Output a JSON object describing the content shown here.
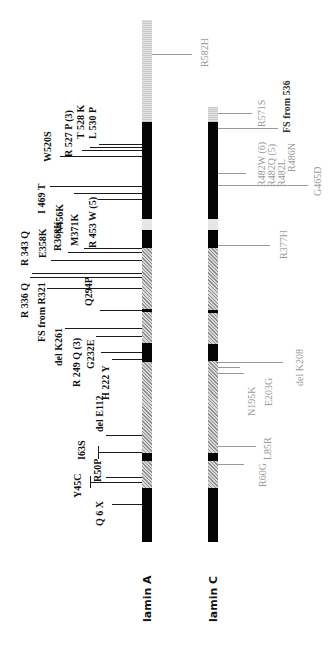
{
  "lamin_a": {
    "label": "lamin A",
    "mutations": [
      {
        "text": "R582H",
        "style": "gray"
      },
      {
        "text": "L 530 P"
      },
      {
        "text": "T 528 K"
      },
      {
        "text": "R 527 P (3)"
      },
      {
        "text": "W520S"
      },
      {
        "text": "I 469 T"
      },
      {
        "text": "N456K"
      },
      {
        "text": "R 453 W (5)"
      },
      {
        "text": "M371K"
      },
      {
        "text": "R368K"
      },
      {
        "text": "E358K"
      },
      {
        "text": "R 343 Q"
      },
      {
        "text": "R 336 Q"
      },
      {
        "text": "FS from R321"
      },
      {
        "text": "Q294P"
      },
      {
        "text": "del K261"
      },
      {
        "text": "R 249 Q (3)"
      },
      {
        "text": "G232E"
      },
      {
        "text": "H 222 Y"
      },
      {
        "text": "del E112"
      },
      {
        "text": "I63S"
      },
      {
        "text": "R50P"
      },
      {
        "text": "Y45C"
      },
      {
        "text": "Q 6 X"
      }
    ]
  },
  "lamin_c": {
    "label": "lamin C",
    "mutations": [
      {
        "text": "R571S"
      },
      {
        "text": "FS from 536"
      },
      {
        "text": "R482W (6)"
      },
      {
        "text": "R482Q (5)"
      },
      {
        "text": "R482L"
      },
      {
        "text": "R486N"
      },
      {
        "text": "G465D"
      },
      {
        "text": "R377H"
      },
      {
        "text": "del K208"
      },
      {
        "text": "E203G"
      },
      {
        "text": "N195K"
      },
      {
        "text": "L85R"
      },
      {
        "text": "R60G"
      }
    ]
  },
  "colors": {
    "rod_domain": "#050505",
    "linker": "#e6e6e6",
    "hatched": "#8f8f8f",
    "lamin_a_text": "#111111",
    "lamin_c_text": "#9a9a9a"
  }
}
